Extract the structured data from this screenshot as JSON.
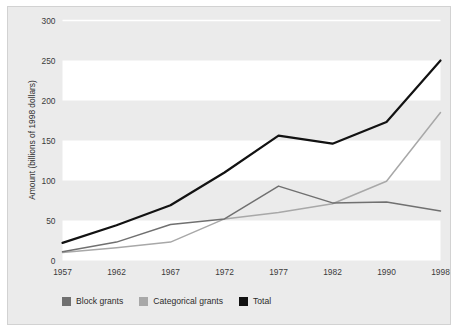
{
  "figure": {
    "background_color": "#ffffff",
    "panel_color": "#ebebeb",
    "panel_border_color": "#d2d2d2",
    "band_color": "#ffffff"
  },
  "legend": {
    "position": "bottom-left",
    "entries": [
      {
        "label": "Block grants",
        "color": "#707070"
      },
      {
        "label": "Categorical grants",
        "color": "#a8a8a8"
      },
      {
        "label": "Total",
        "color": "#121212"
      }
    ]
  },
  "chart_data": {
    "type": "line",
    "title": "",
    "subtitle": "",
    "xlabel": "",
    "ylabel": "Amount (billions of 1998 dollars)",
    "categories": [
      "1957",
      "1962",
      "1967",
      "1972",
      "1977",
      "1982",
      "1990",
      "1998"
    ],
    "x": [
      1957,
      1962,
      1967,
      1972,
      1977,
      1982,
      1990,
      1998
    ],
    "xtick_labels": [
      "1957",
      "1962",
      "1967",
      "1972",
      "1977",
      "1982",
      "1990",
      "1998"
    ],
    "ytick_labels": [
      "0",
      "50",
      "100",
      "150",
      "200",
      "250",
      "300"
    ],
    "yticks": [
      0,
      50,
      100,
      150,
      200,
      250,
      300
    ],
    "ylim": [
      0,
      300
    ],
    "grid": "horizontal-bands",
    "legend_position": "bottom-left",
    "series": [
      {
        "name": "Block grants",
        "color": "#707070",
        "values": [
          11,
          23,
          45,
          52,
          93,
          72,
          73,
          62
        ]
      },
      {
        "name": "Categorical grants",
        "color": "#a8a8a8",
        "values": [
          10,
          16,
          23,
          52,
          60,
          71,
          99,
          185
        ]
      },
      {
        "name": "Total",
        "color": "#121212",
        "values": [
          22,
          44,
          69,
          110,
          156,
          146,
          173,
          250
        ]
      }
    ]
  }
}
